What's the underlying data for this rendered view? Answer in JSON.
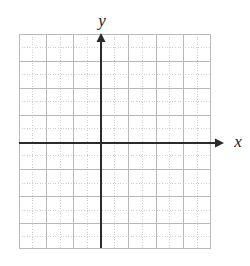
{
  "figure": {
    "kind": "cartesian-coordinate-grid",
    "title": "",
    "background_color": "#ffffff"
  },
  "axes": {
    "x": {
      "label": "x",
      "color": "#2b2b2b",
      "arrow": "right",
      "line_y": 143,
      "start_x": 19,
      "end_x": 224
    },
    "y": {
      "label": "y",
      "color": "#2b2b2b",
      "arrow": "up",
      "line_x": 101,
      "start_y": 33,
      "end_y": 248
    },
    "origin": {
      "x": 101,
      "y": 143
    }
  },
  "grid": {
    "left": 19,
    "top": 34,
    "right": 211,
    "bottom": 248,
    "major_color": "#b9b9b9",
    "minor_color": "#cfcfcf",
    "minor_style": "dotted",
    "cell_size_px": 13.7,
    "columns_major": 7,
    "rows_major": 8,
    "columns_total": 14,
    "rows_total": 16,
    "major_x_positions": [
      19,
      46.4,
      73.8,
      101.2,
      128.6,
      156,
      183.4,
      210.8
    ],
    "minor_x_positions": [
      32.7,
      60.1,
      87.5,
      114.9,
      142.3,
      169.7,
      197.1
    ],
    "major_y_positions": [
      34,
      61.1,
      88.2,
      115.3,
      142.4,
      169.5,
      196.6,
      223.7,
      248
    ],
    "minor_y_positions": [
      47.5,
      74.6,
      101.7,
      128.8,
      155.9,
      183,
      210.1,
      236
    ]
  },
  "chart_data": {
    "type": "scatter",
    "title": "",
    "xlabel": "x",
    "ylabel": "y",
    "series": [],
    "x": [],
    "y": [],
    "xlim": [
      -7,
      7
    ],
    "ylim": [
      -8,
      8
    ],
    "grid": true,
    "legend": "none",
    "annotations": []
  }
}
